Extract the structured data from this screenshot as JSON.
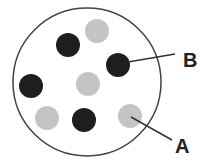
{
  "diagram": {
    "container": {
      "cx": 87,
      "cy": 82,
      "r": 74,
      "stroke": "#444444"
    },
    "colors": {
      "dark": "#1e1e1e",
      "light": "#c4c4c4"
    },
    "particles": [
      {
        "id": "light-top",
        "cx": 97,
        "cy": 31,
        "r": 12,
        "shade": "light"
      },
      {
        "id": "dark-top-left",
        "cx": 68,
        "cy": 45,
        "r": 12,
        "shade": "dark"
      },
      {
        "id": "dark-b",
        "cx": 118,
        "cy": 65,
        "r": 12,
        "shade": "dark"
      },
      {
        "id": "dark-left",
        "cx": 31,
        "cy": 86,
        "r": 12,
        "shade": "dark"
      },
      {
        "id": "light-center",
        "cx": 88,
        "cy": 84,
        "r": 12,
        "shade": "light"
      },
      {
        "id": "light-bottom-left",
        "cx": 47,
        "cy": 118,
        "r": 12,
        "shade": "light"
      },
      {
        "id": "dark-bottom",
        "cx": 84,
        "cy": 120,
        "r": 12,
        "shade": "dark"
      },
      {
        "id": "light-a",
        "cx": 130,
        "cy": 116,
        "r": 12,
        "shade": "light"
      }
    ],
    "labels": [
      {
        "text": "B",
        "x": 183,
        "y": 67,
        "line": {
          "x1": 128,
          "y1": 62,
          "x2": 175,
          "y2": 54
        }
      },
      {
        "text": "A",
        "x": 175,
        "y": 153,
        "line": {
          "x1": 131,
          "y1": 117,
          "x2": 172,
          "y2": 140
        }
      }
    ]
  }
}
